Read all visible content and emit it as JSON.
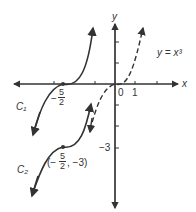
{
  "figure": {
    "axes": {
      "x_label": "x",
      "y_label": "y"
    },
    "x_ticks": {
      "zero": "0",
      "one": "1"
    },
    "y_ticks": {
      "neg_three": "−3"
    },
    "equation_label": "y = x³",
    "curve_labels": {
      "c1": "C₁",
      "c2": "C₂"
    },
    "point_c1": {
      "sign": "−",
      "num": "5",
      "den": "2"
    },
    "point_c2": {
      "open": "(−",
      "num": "5",
      "den": "2",
      "close": ", −3)"
    },
    "colors": {
      "ink": "#333333",
      "background": "#ffffff"
    }
  }
}
